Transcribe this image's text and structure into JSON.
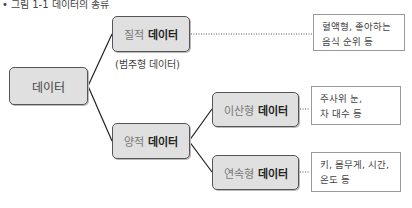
{
  "caption": "• 그림 1-1 데이터의 종류",
  "root": {
    "label": "데이터"
  },
  "qualitative": {
    "prefix": "질적",
    "suffix": "데이터",
    "note": "(범주형 데이터)",
    "example": "혈액형, 좋아하는\n음식 순위 등"
  },
  "quantitative": {
    "prefix": "양적",
    "suffix": "데이터",
    "children": [
      {
        "prefix": "이산형",
        "suffix": "데이터",
        "example": "주사위 눈,\n차 대수 등"
      },
      {
        "prefix": "연속형",
        "suffix": "데이터",
        "example": "키, 몸무게, 시간,\n온도 등"
      }
    ]
  },
  "colors": {
    "node_fill": "#e0e0e0",
    "node_border": "#555555",
    "desc_border": "#999999"
  }
}
